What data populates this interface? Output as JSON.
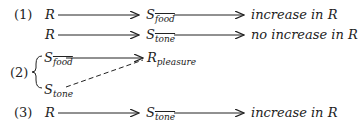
{
  "diagram": {
    "rows": [
      {
        "label": "(1)",
        "from": "R",
        "mid_base": "S",
        "mid_sub": "food",
        "result": "increase in R"
      },
      {
        "label": "",
        "from": "R",
        "mid_base": "S",
        "mid_sub": "tone",
        "result": "no increase in R"
      },
      {
        "label": "(2)",
        "top_base": "S",
        "top_sub": "food",
        "bottom_base": "S",
        "bottom_sub": "tone",
        "target_base": "R",
        "target_sub": "pleasure"
      },
      {
        "label": "(3)",
        "from": "R",
        "mid_base": "S",
        "mid_sub": "tone",
        "result": "increase in R"
      }
    ]
  }
}
